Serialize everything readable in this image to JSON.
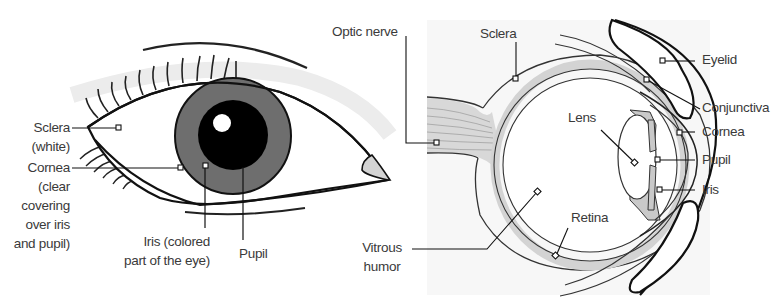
{
  "front_view": {
    "name": "Front view of the eye",
    "labels": {
      "sclera": [
        "Sclera",
        "(white)"
      ],
      "cornea": [
        "Cornea",
        "(clear",
        "covering",
        "over iris",
        "and pupil)"
      ],
      "iris": [
        "Iris (colored",
        "part of the eye)"
      ],
      "pupil": "Pupil"
    }
  },
  "cross_section": {
    "name": "Cross-section of the eye",
    "labels": {
      "optic_nerve": "Optic nerve",
      "sclera": "Sclera",
      "eyelid": "Eyelid",
      "conjunctiva": "Conjunctiva",
      "cornea": "Cornea",
      "lens": "Lens",
      "pupil": "Pupil",
      "iris": "Iris",
      "retina": "Retina",
      "vitrous_humor": [
        "Vitrous",
        "humor"
      ]
    }
  },
  "colors": {
    "line": "#111111",
    "iris": "#6e6e6e",
    "pupil": "#000000",
    "tissue_gray": "#d3d3d3",
    "label_text": "#3a3a3a",
    "panel_bg": "#f7f7f7"
  }
}
